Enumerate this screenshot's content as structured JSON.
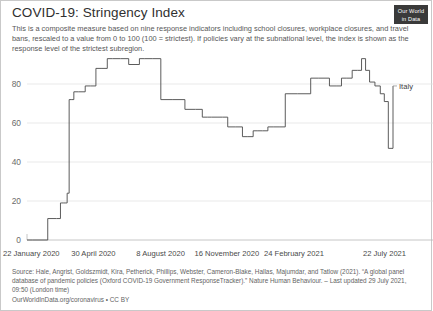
{
  "header": {
    "title": "COVID-19: Stringency Index",
    "subtitle": "This is a composite measure based on nine response indicators including school closures, workplace closures, and travel bans, rescaled to a value from 0 to 100 (100 = strictest). If policies vary at the subnational level, the index is shown as the response level of the strictest subregion.",
    "logo_line1": "Our World",
    "logo_line2": "in Data"
  },
  "footer": {
    "source_line1": "Source: Hale, Angrist, Goldszmidt, Kira, Petherick, Phillips, Webster, Cameron-Blake, Hallas, Majumdar, and Tatlow (2021). “A global panel",
    "source_line2": "database of pandemic policies (Oxford COVID-19 Government ResponseTracker).” Nature Human Behaviour. – Last updated 29 July 2021,",
    "source_line3": "09:50 (London time)",
    "link": "OurWorldInData.org/coronavirus",
    "license": "CC BY",
    "link_separator": " • "
  },
  "chart_data": {
    "type": "line",
    "title": "COVID-19: Stringency Index",
    "xlabel": "",
    "ylabel": "",
    "ylim": [
      0,
      100
    ],
    "yticks": [
      0,
      20,
      40,
      60,
      80
    ],
    "ytick_labels": [
      "0",
      "20",
      "40",
      "60",
      "80"
    ],
    "grid": true,
    "legend_position": "right-inline",
    "xtick_labels": [
      "22 January 2020",
      "30 April 2020",
      "8 August 2020",
      "16 November 2020",
      "24 February 2021",
      "22 July 2021"
    ],
    "xtick_positions": [
      0,
      99,
      200,
      299,
      399,
      547
    ],
    "x_range": [
      0,
      547
    ],
    "x_unit": "days since 22 January 2020",
    "series": [
      {
        "name": "Italy",
        "color": "#4a4a4a",
        "step": "post",
        "x": [
          0,
          8,
          31,
          44,
          50,
          52,
          55,
          57,
          60,
          63,
          66,
          70,
          77,
          87,
          95,
          103,
          112,
          120,
          128,
          140,
          152,
          168,
          176,
          188,
          200,
          218,
          236,
          252,
          262,
          270,
          276,
          284,
          292,
          300,
          312,
          322,
          330,
          338,
          344,
          352,
          360,
          368,
          378,
          386,
          396,
          404,
          414,
          424,
          436,
          452,
          462,
          470,
          478,
          486,
          494,
          500,
          506,
          512,
          520,
          528,
          534,
          540,
          547
        ],
        "y": [
          0,
          0,
          11,
          11,
          19,
          19,
          19,
          19,
          24,
          72,
          72,
          76,
          76,
          79,
          79,
          88,
          88,
          93,
          93,
          93,
          90,
          93,
          93,
          93,
          72,
          72,
          67,
          67,
          63,
          63,
          63,
          63,
          63,
          58,
          58,
          53,
          53,
          56,
          56,
          56,
          58,
          58,
          58,
          75,
          75,
          75,
          75,
          83,
          83,
          79,
          79,
          83,
          83,
          87,
          87,
          93,
          87,
          81,
          79,
          75,
          71,
          47,
          79
        ]
      }
    ],
    "series_label": "Italy"
  }
}
